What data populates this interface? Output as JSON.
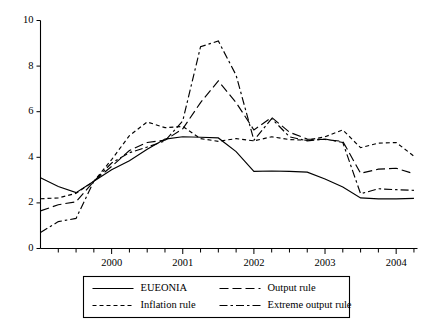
{
  "chart_data": {
    "type": "line",
    "title": "",
    "subtitle": "",
    "xlabel": "",
    "ylabel": "",
    "xlim": [
      1999.0,
      2004.3
    ],
    "ylim": [
      0,
      10
    ],
    "grid": false,
    "legend_position": "below-outside",
    "y_ticks": [
      "0",
      "2",
      "4",
      "6",
      "8",
      "10"
    ],
    "y_tick_values": [
      0,
      2,
      4,
      6,
      8,
      10
    ],
    "x_ticks": [
      "2000",
      "2001",
      "2002",
      "2003",
      "2004"
    ],
    "x_tick_values": [
      2000,
      2001,
      2002,
      2003,
      2004
    ],
    "x_minor_tick_values": [
      1999.25,
      1999.5,
      1999.75,
      2000.25,
      2000.5,
      2000.75,
      2001.25,
      2001.5,
      2001.75,
      2002.25,
      2002.5,
      2002.75,
      2003.25,
      2003.5,
      2003.75,
      2004.25
    ],
    "x": [
      1999.0,
      1999.25,
      1999.5,
      1999.75,
      2000.0,
      2000.25,
      2000.5,
      2000.75,
      2001.0,
      2001.25,
      2001.5,
      2001.75,
      2002.0,
      2002.25,
      2002.5,
      2002.75,
      2003.0,
      2003.25,
      2003.5,
      2003.75,
      2004.0,
      2004.25
    ],
    "series": [
      {
        "name": "EUEONIA",
        "dash": "solid",
        "values": [
          3.1,
          2.72,
          2.45,
          2.95,
          3.45,
          3.85,
          4.35,
          4.8,
          4.9,
          4.88,
          4.85,
          4.25,
          3.38,
          3.4,
          3.38,
          3.35,
          3.05,
          2.7,
          2.22,
          2.18,
          2.18,
          2.2
        ]
      },
      {
        "name": "Output rule",
        "dash": "long-dash",
        "values": [
          1.65,
          1.92,
          2.05,
          2.95,
          3.6,
          4.3,
          4.65,
          4.75,
          5.25,
          6.4,
          7.35,
          6.4,
          5.2,
          5.75,
          5.1,
          4.8,
          4.78,
          4.7,
          3.3,
          3.48,
          3.52,
          3.28
        ]
      },
      {
        "name": "Inflation rule",
        "dash": "short-dash",
        "values": [
          2.18,
          2.22,
          2.42,
          2.95,
          3.9,
          4.95,
          5.55,
          5.3,
          5.35,
          4.82,
          4.7,
          4.82,
          4.72,
          4.9,
          4.78,
          4.75,
          4.9,
          5.2,
          4.42,
          4.62,
          4.65,
          4.05
        ]
      },
      {
        "name": "Extreme output rule",
        "dash": "dash-dot",
        "values": [
          0.7,
          1.18,
          1.32,
          2.95,
          3.75,
          4.2,
          4.45,
          4.72,
          5.6,
          8.85,
          9.1,
          7.6,
          4.75,
          5.7,
          4.9,
          4.72,
          4.8,
          4.65,
          2.4,
          2.62,
          2.58,
          2.55
        ]
      }
    ],
    "legend_entries": [
      {
        "label": "EUEONIA",
        "dash": "solid"
      },
      {
        "label": "Output rule",
        "dash": "long-dash"
      },
      {
        "label": "Inflation rule",
        "dash": "short-dash"
      },
      {
        "label": "Extreme output rule",
        "dash": "dash-dot"
      }
    ],
    "colors": {
      "ink": "#000000",
      "background": "#ffffff"
    }
  }
}
